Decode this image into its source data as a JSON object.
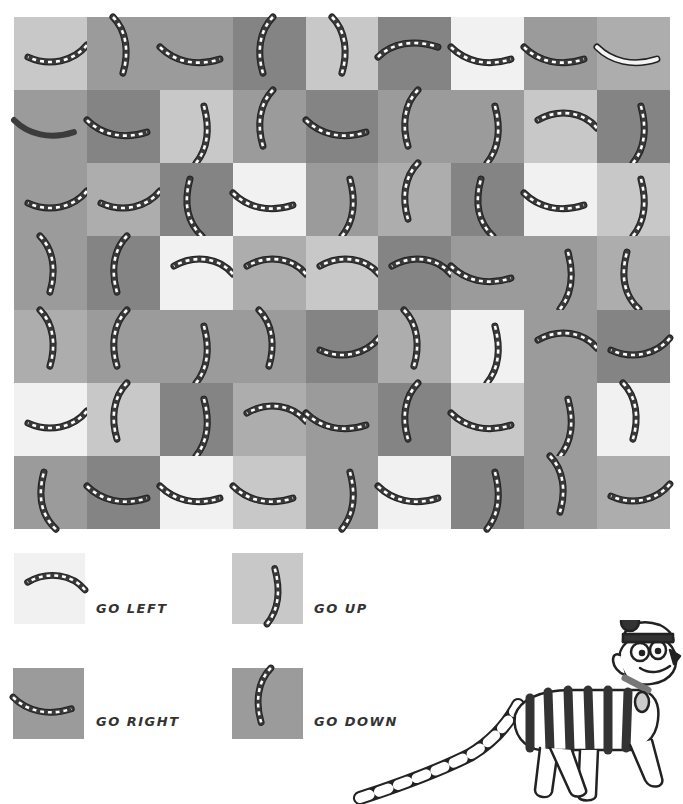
{
  "puzzle": {
    "rows": 7,
    "cols": 9,
    "tones": {
      "W": "#f1f1f1",
      "L": "#c8c8c8",
      "ML": "#adadad",
      "M": "#9b9b9b",
      "D": "#848484"
    },
    "grid": [
      [
        {
          "t": "L",
          "s": "L-smile"
        },
        {
          "t": "M",
          "s": "D-)"
        },
        {
          "t": "M",
          "s": "R-smile"
        },
        {
          "t": "D",
          "s": "D-("
        },
        {
          "t": "L",
          "s": "D-)"
        },
        {
          "t": "D",
          "s": "R-frown"
        },
        {
          "t": "W",
          "s": "R-smile"
        },
        {
          "t": "M",
          "s": "R-smile"
        },
        {
          "t": "ML",
          "s": "R-smile-light"
        }
      ],
      [
        {
          "t": "M",
          "s": "R-smile-solid"
        },
        {
          "t": "D",
          "s": "R-smile"
        },
        {
          "t": "L",
          "s": "U-)"
        },
        {
          "t": "M",
          "s": "D-("
        },
        {
          "t": "D",
          "s": "R-smile"
        },
        {
          "t": "M",
          "s": "D-("
        },
        {
          "t": "M",
          "s": "U-)"
        },
        {
          "t": "L",
          "s": "L-frown"
        },
        {
          "t": "D",
          "s": "U-)"
        }
      ],
      [
        {
          "t": "M",
          "s": "L-smile"
        },
        {
          "t": "ML",
          "s": "L-smile"
        },
        {
          "t": "D",
          "s": "U-("
        },
        {
          "t": "W",
          "s": "R-smile"
        },
        {
          "t": "M",
          "s": "U-)"
        },
        {
          "t": "ML",
          "s": "D-("
        },
        {
          "t": "D",
          "s": "U-("
        },
        {
          "t": "W",
          "s": "R-smile"
        },
        {
          "t": "L",
          "s": "U-)"
        }
      ],
      [
        {
          "t": "M",
          "s": "D-)"
        },
        {
          "t": "D",
          "s": "D-("
        },
        {
          "t": "W",
          "s": "L-frown"
        },
        {
          "t": "ML",
          "s": "L-frown"
        },
        {
          "t": "L",
          "s": "L-frown"
        },
        {
          "t": "D",
          "s": "L-frown"
        },
        {
          "t": "M",
          "s": "R-smile"
        },
        {
          "t": "M",
          "s": "U-)"
        },
        {
          "t": "ML",
          "s": "U-("
        }
      ],
      [
        {
          "t": "ML",
          "s": "D-)"
        },
        {
          "t": "M",
          "s": "D-("
        },
        {
          "t": "M",
          "s": "U-)"
        },
        {
          "t": "M",
          "s": "D-)"
        },
        {
          "t": "D",
          "s": "L-smile"
        },
        {
          "t": "ML",
          "s": "D-)"
        },
        {
          "t": "W",
          "s": "U-)"
        },
        {
          "t": "M",
          "s": "L-frown"
        },
        {
          "t": "D",
          "s": "L-smile"
        }
      ],
      [
        {
          "t": "W",
          "s": "L-smile"
        },
        {
          "t": "L",
          "s": "D-("
        },
        {
          "t": "D",
          "s": "U-)"
        },
        {
          "t": "ML",
          "s": "L-frown"
        },
        {
          "t": "M",
          "s": "R-smile"
        },
        {
          "t": "D",
          "s": "D-("
        },
        {
          "t": "L",
          "s": "R-smile"
        },
        {
          "t": "M",
          "s": "U-)"
        },
        {
          "t": "W",
          "s": "D-)"
        }
      ],
      [
        {
          "t": "M",
          "s": "U-("
        },
        {
          "t": "D",
          "s": "R-smile"
        },
        {
          "t": "W",
          "s": "R-smile"
        },
        {
          "t": "L",
          "s": "R-smile"
        },
        {
          "t": "M",
          "s": "U-)"
        },
        {
          "t": "W",
          "s": "R-smile"
        },
        {
          "t": "D",
          "s": "U-)"
        },
        {
          "t": "M",
          "s": "D-)"
        },
        {
          "t": "ML",
          "s": "L-smile"
        }
      ]
    ]
  },
  "legend": [
    {
      "label": "GO LEFT",
      "shape": "L-frown",
      "tone": "W"
    },
    {
      "label": "GO UP",
      "shape": "U-)",
      "tone": "L"
    },
    {
      "label": "GO RIGHT",
      "shape": "R-smile",
      "tone": "M"
    },
    {
      "label": "GO DOWN",
      "shape": "D-(",
      "tone": "M"
    }
  ],
  "mascot": {
    "name": "woof-dog-icon"
  }
}
